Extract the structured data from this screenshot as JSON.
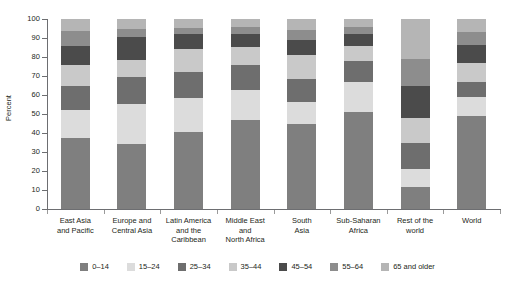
{
  "chart_data": {
    "type": "bar",
    "subtype": "stacked-bar-100-percent",
    "title": "",
    "xlabel": "",
    "ylabel": "Percent",
    "ylim": [
      0,
      100
    ],
    "yticks": [
      0,
      10,
      20,
      30,
      40,
      50,
      60,
      70,
      80,
      90,
      100
    ],
    "ytick_labels": [
      "0",
      "10",
      "20",
      "30",
      "40",
      "50",
      "60",
      "70",
      "80",
      "90",
      "100"
    ],
    "grid": false,
    "legend_position": "bottom",
    "stacking_order": "bottom-to-top",
    "categories": [
      "East Asia and Pacific",
      "Europe and Central Asia",
      "Latin America and the Caribbean",
      "Middle East and North Africa",
      "South Asia",
      "Sub-Saharan Africa",
      "Rest of the world",
      "World"
    ],
    "category_label_lines": [
      [
        "East Asia",
        "and Pacific"
      ],
      [
        "Europe and",
        "Central Asia"
      ],
      [
        "Latin America",
        "and the",
        "Caribbean"
      ],
      [
        "Middle East",
        "and",
        "North Africa"
      ],
      [
        "South",
        "Asia"
      ],
      [
        "Sub-Saharan",
        "Africa"
      ],
      [
        "Rest of the",
        "world"
      ],
      [
        "World"
      ]
    ],
    "series": [
      {
        "name": "0–14",
        "color": "#7f7f7f",
        "values": [
          37.5,
          34.0,
          40.5,
          47.0,
          44.5,
          51.0,
          11.5,
          49.0
        ]
      },
      {
        "name": "15–24",
        "color": "#dcdcdc",
        "values": [
          14.5,
          21.5,
          18.0,
          15.5,
          12.0,
          16.0,
          9.5,
          10.0
        ]
      },
      {
        "name": "25–34",
        "color": "#6e6e6e",
        "values": [
          12.5,
          14.0,
          13.5,
          13.5,
          12.0,
          11.0,
          14.0,
          8.0
        ]
      },
      {
        "name": "35–44",
        "color": "#c9c9c9",
        "values": [
          11.5,
          9.0,
          12.0,
          9.5,
          12.5,
          8.0,
          13.0,
          10.0
        ]
      },
      {
        "name": "45–54",
        "color": "#4b4b4b",
        "values": [
          10.0,
          12.0,
          8.0,
          6.5,
          8.0,
          6.0,
          17.0,
          9.5
        ]
      },
      {
        "name": "55–64",
        "color": "#8d8d8d",
        "values": [
          7.5,
          4.5,
          3.5,
          4.0,
          5.0,
          4.0,
          14.0,
          6.5
        ]
      },
      {
        "name": "65 and older",
        "color": "#b5b5b5",
        "values": [
          6.5,
          5.0,
          4.5,
          4.0,
          6.0,
          4.0,
          21.0,
          7.0
        ]
      }
    ],
    "legend_entries": [
      {
        "label": "0–14",
        "color": "#7f7f7f"
      },
      {
        "label": "15–24",
        "color": "#dcdcdc"
      },
      {
        "label": "25–34",
        "color": "#6e6e6e"
      },
      {
        "label": "35–44",
        "color": "#c9c9c9"
      },
      {
        "label": "45–54",
        "color": "#4b4b4b"
      },
      {
        "label": "55–64",
        "color": "#8d8d8d"
      },
      {
        "label": "65 and older",
        "color": "#b5b5b5"
      }
    ]
  }
}
